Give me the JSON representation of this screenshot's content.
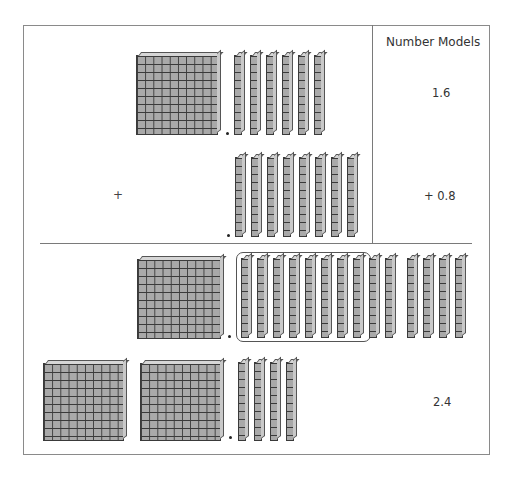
{
  "header": {
    "title": "Number Models"
  },
  "rows": {
    "addend1": {
      "number_model": "1.6",
      "flats": 1,
      "rods": 6,
      "flat_positions": [
        {
          "left": 136,
          "top": 55,
          "width": 82,
          "height": 80
        }
      ],
      "rod_positions": [
        234,
        250,
        266,
        282,
        298,
        314
      ],
      "rod_top": 55,
      "rod_height": 80,
      "dot": {
        "left": 226,
        "top": 132
      }
    },
    "addend2": {
      "operator": "+",
      "number_model": "+ 0.8",
      "flats": 0,
      "rods": 8,
      "rod_positions": [
        235,
        251,
        267,
        283,
        299,
        315,
        331,
        347
      ],
      "rod_top": 157,
      "rod_height": 80,
      "dot": {
        "left": 227,
        "top": 234
      }
    },
    "combined": {
      "flats": 1,
      "rods_grouped": 10,
      "rods_extra": 4,
      "flat_positions": [
        {
          "left": 137,
          "top": 259,
          "width": 84,
          "height": 80
        }
      ],
      "grouped_rod_positions": [
        241,
        257,
        273,
        289,
        305,
        321,
        337,
        353,
        369,
        385
      ],
      "extra_rod_positions": [
        407,
        423,
        439,
        455
      ],
      "rod_top": 258,
      "rod_height": 80,
      "group_box": {
        "left": 236,
        "top": 252,
        "width": 135,
        "height": 90
      },
      "dot": {
        "left": 228,
        "top": 335
      }
    },
    "result": {
      "number_model": "2.4",
      "flats": 2,
      "rods": 4,
      "flat_positions": [
        {
          "left": 43,
          "top": 363,
          "width": 81,
          "height": 78
        },
        {
          "left": 140,
          "top": 363,
          "width": 81,
          "height": 78
        }
      ],
      "rod_positions": [
        238,
        254,
        270,
        286
      ],
      "rod_top": 362,
      "rod_height": 79,
      "dot": {
        "left": 229,
        "top": 436
      }
    }
  },
  "colors": {
    "block_fill": "#a9a9a9",
    "grid_line": "#3a3a3a",
    "frame": "#8a8a8a"
  }
}
